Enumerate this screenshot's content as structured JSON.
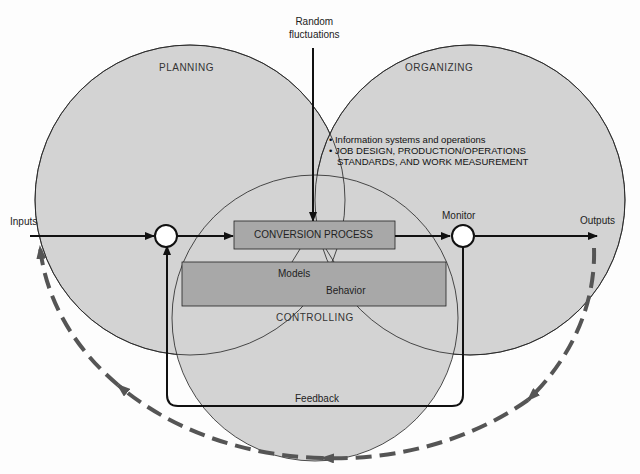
{
  "diagram": {
    "regions": {
      "planning": "PLANNING",
      "organizing": "ORGANIZING",
      "controlling": "CONTROLLING"
    },
    "top_input": {
      "line1": "Random",
      "line2": "fluctuations"
    },
    "organizing_bullets": [
      "Information systems and operations",
      "JOB DESIGN, PRODUCTION/OPERATIONS",
      "STANDARDS, AND WORK MEASUREMENT"
    ],
    "inputs": "Inputs",
    "outputs": "Outputs",
    "monitor": "Monitor",
    "conversion_process": "CONVERSION PROCESS",
    "models": "Models",
    "behavior": "Behavior",
    "feedback": "Feedback",
    "colors": {
      "circle_fill": "#d3d3d3",
      "box_fill": "#a8a8a8",
      "dashed_arrow": "#555555",
      "line": "#111111"
    }
  }
}
